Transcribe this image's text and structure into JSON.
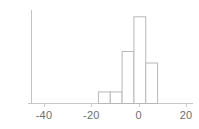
{
  "figure": {
    "kind": "histogram-figure",
    "background_color": "#ffffff",
    "bar_fill_color": "#ffffff",
    "bar_stroke_color": "#b8b8b8",
    "axis_color": "#c2c2c2",
    "tick_color": "#c8c8c8",
    "label_color": "#6e6e6e"
  },
  "chart_data": {
    "type": "bar",
    "title": "",
    "subtitle": "",
    "xlabel": "",
    "ylabel": "",
    "grid": false,
    "legend": null,
    "legend_position": "none",
    "orientation": "vertical",
    "bin_width": 5,
    "xlim": [
      -45,
      21
    ],
    "ylim": [
      0,
      16
    ],
    "xticks": [
      -40,
      -20,
      0,
      20
    ],
    "xticklabels": [
      "-40",
      "-20",
      "0",
      "20"
    ],
    "yticks": [],
    "yticklabels": [],
    "categories": [
      "-17 to -12",
      "-12 to -7",
      "-7 to -2",
      "-2 to 3",
      "3 to 8"
    ],
    "bin_edges": [
      -17,
      -12,
      -7,
      -2,
      3,
      8
    ],
    "bin_centers": [
      -14.5,
      -9.5,
      -4.5,
      0.5,
      5.5
    ],
    "values": [
      2,
      2,
      9,
      15,
      7
    ],
    "annotations": []
  },
  "axis": {
    "x_axis_name": "x-axis-line",
    "y_axis_name": "y-axis-line",
    "tick_labels": [
      {
        "text": "-40",
        "value": -40
      },
      {
        "text": "-20",
        "value": -20
      },
      {
        "text": "0",
        "value": 0
      },
      {
        "text": "20",
        "value": 20
      }
    ]
  }
}
